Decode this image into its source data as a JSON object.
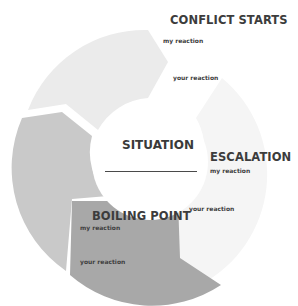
{
  "diagram": {
    "center": {
      "title": "SITUATION"
    },
    "stages": [
      {
        "id": "conflict-starts",
        "title": "CONFLICT STARTS",
        "my_label": "my reaction",
        "your_label": "your reaction",
        "color": "#ebebeb"
      },
      {
        "id": "escalation",
        "title": "ESCALATION",
        "my_label": "my reaction",
        "your_label": "your reaction",
        "color": "#f5f5f5"
      },
      {
        "id": "boiling-point",
        "title": "BOILING POINT",
        "my_label": "my reaction",
        "your_label": "your reaction",
        "color": "#a8a8a8"
      },
      {
        "id": "unlabeled",
        "title": "",
        "color": "#c9c9c9"
      }
    ]
  }
}
